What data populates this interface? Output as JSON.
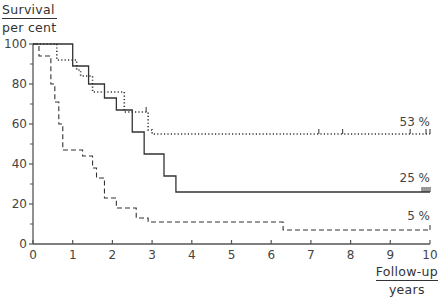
{
  "chart_data": {
    "type": "line",
    "subtype": "kaplan-meier step",
    "title": "",
    "ylabel": "Survival per cent",
    "ylabel_lines": [
      "Survival",
      "per cent"
    ],
    "xlabel": "Follow-up years",
    "xlabel_lines": [
      "Follow-up",
      "years"
    ],
    "xlim": [
      0,
      10
    ],
    "ylim": [
      0,
      100
    ],
    "x_ticks": [
      0,
      1,
      2,
      3,
      4,
      5,
      6,
      7,
      8,
      9,
      10
    ],
    "y_ticks": [
      0,
      20,
      40,
      60,
      80,
      100
    ],
    "y_minor_ticks": [
      10,
      30,
      50,
      70,
      90
    ],
    "grid": false,
    "legend": "none (curves labelled at right end)",
    "series": [
      {
        "name": "53 %",
        "end_label": "53 %",
        "style": "dotted",
        "steps": [
          [
            0,
            100
          ],
          [
            0.6,
            92
          ],
          [
            1.1,
            87
          ],
          [
            1.2,
            84
          ],
          [
            1.5,
            76
          ],
          [
            2.3,
            66
          ],
          [
            2.9,
            57
          ],
          [
            3.0,
            55
          ],
          [
            10,
            55
          ]
        ],
        "censor_ticks": [
          2.85,
          7.2,
          7.8,
          9.5,
          9.9,
          10.0
        ]
      },
      {
        "name": "25 %",
        "end_label": "25 %",
        "style": "solid",
        "steps": [
          [
            0,
            100
          ],
          [
            1.0,
            89
          ],
          [
            1.4,
            80
          ],
          [
            1.8,
            73
          ],
          [
            2.1,
            67
          ],
          [
            2.5,
            56
          ],
          [
            2.8,
            45
          ],
          [
            3.3,
            34
          ],
          [
            3.6,
            26
          ],
          [
            10,
            26
          ]
        ],
        "censor_ticks": [
          9.8,
          9.85,
          9.9,
          9.95,
          10.0
        ]
      },
      {
        "name": "5 %",
        "end_label": "5 %",
        "style": "dashed",
        "steps": [
          [
            0,
            100
          ],
          [
            0.15,
            94
          ],
          [
            0.45,
            80
          ],
          [
            0.55,
            71
          ],
          [
            0.65,
            60
          ],
          [
            0.75,
            47
          ],
          [
            1.25,
            44
          ],
          [
            1.5,
            38
          ],
          [
            1.6,
            33
          ],
          [
            1.8,
            23
          ],
          [
            2.1,
            18
          ],
          [
            2.6,
            13
          ],
          [
            2.9,
            11
          ],
          [
            6.3,
            7
          ],
          [
            10,
            7
          ]
        ],
        "censor_ticks": [
          10.0
        ]
      }
    ]
  },
  "axes": {
    "y_ticks_labels": [
      "0",
      "20",
      "40",
      "60",
      "80",
      "100"
    ],
    "x_ticks_labels": [
      "0",
      "1",
      "2",
      "3",
      "4",
      "5",
      "6",
      "7",
      "8",
      "9",
      "10"
    ]
  }
}
